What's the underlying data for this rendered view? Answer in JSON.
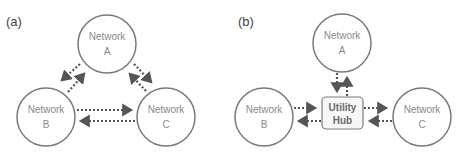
{
  "panels": [
    {
      "label": "(a)",
      "nodes": {
        "a": {
          "line1": "Network",
          "line2": "A"
        },
        "b": {
          "line1": "Network",
          "line2": "B"
        },
        "c": {
          "line1": "Network",
          "line2": "C"
        }
      },
      "topology": "mesh"
    },
    {
      "label": "(b)",
      "nodes": {
        "a": {
          "line1": "Network",
          "line2": "A"
        },
        "b": {
          "line1": "Network",
          "line2": "B"
        },
        "c": {
          "line1": "Network",
          "line2": "C"
        }
      },
      "hub": {
        "line1": "Utility",
        "line2": "Hub"
      },
      "topology": "hub-and-spoke"
    }
  ],
  "colors": {
    "stroke": "#7a7a7a",
    "arrow": "#555555",
    "text": "#8a8a8a",
    "hub_fill": "#f7f7f7"
  }
}
